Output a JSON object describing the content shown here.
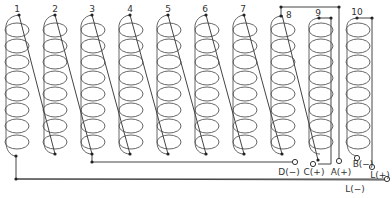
{
  "diagram": {
    "type": "wiring-diagram",
    "coils": [
      {
        "label": "1",
        "x": 16
      },
      {
        "label": "2",
        "x": 54
      },
      {
        "label": "3",
        "x": 92
      },
      {
        "label": "4",
        "x": 130
      },
      {
        "label": "5",
        "x": 168
      },
      {
        "label": "6",
        "x": 206
      },
      {
        "label": "7",
        "x": 244
      },
      {
        "label": "8",
        "x": 282
      },
      {
        "label": "9",
        "x": 320
      },
      {
        "label": "10",
        "x": 358
      }
    ],
    "terminals": {
      "d_minus": "D(−)",
      "c_plus": "C(+)",
      "a_plus": "A(+)",
      "b_minus": "B(−)",
      "l_plus": "L(+)",
      "l_minus": "L(−)"
    }
  }
}
